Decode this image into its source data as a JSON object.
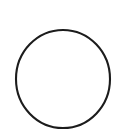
{
  "canvas": {
    "width": 124,
    "height": 140,
    "background_color": "#ffffff",
    "label": "drawing-canvas"
  },
  "figure": {
    "type": "circle-outline",
    "name": "circle",
    "stroke_color": "#1c1c1c",
    "fill": "none",
    "fill_label": "none",
    "stroke_width": 2.1,
    "center_x": 63,
    "center_y": 79,
    "radius": 47,
    "radius_x": 47,
    "radius_y": 49,
    "bounds": {
      "left": 16,
      "top": 30,
      "right": 110,
      "bottom": 129
    }
  }
}
